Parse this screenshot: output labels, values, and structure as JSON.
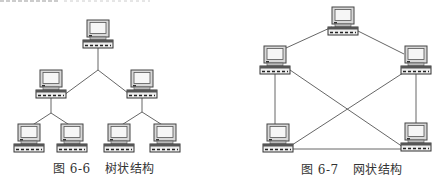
{
  "figures": [
    {
      "id": "fig-6-6",
      "caption_prefix": "图",
      "caption_number": "6-6",
      "caption_title": "树状结构",
      "topology": "tree",
      "nodes": [
        {
          "name": "root",
          "x": 98,
          "y": 20
        },
        {
          "name": "mid-left",
          "x": 51,
          "y": 70
        },
        {
          "name": "mid-right",
          "x": 142,
          "y": 70
        },
        {
          "name": "leaf-1",
          "x": 29,
          "y": 124
        },
        {
          "name": "leaf-2",
          "x": 72,
          "y": 124
        },
        {
          "name": "leaf-3",
          "x": 119,
          "y": 124
        },
        {
          "name": "leaf-4",
          "x": 165,
          "y": 124
        }
      ]
    },
    {
      "id": "fig-6-7",
      "caption_prefix": "图",
      "caption_number": "6-7",
      "caption_title": "网状结构",
      "topology": "mesh",
      "nodes": [
        {
          "name": "top",
          "x": 343,
          "y": 7
        },
        {
          "name": "left",
          "x": 275,
          "y": 46
        },
        {
          "name": "right",
          "x": 416,
          "y": 46
        },
        {
          "name": "bottom-left",
          "x": 278,
          "y": 124
        },
        {
          "name": "bottom-right",
          "x": 416,
          "y": 123
        }
      ]
    }
  ],
  "colors": {
    "line": "#555555",
    "monitor_frame": "#444444",
    "screen": "#f4f4f4",
    "base": "#3a3a3a",
    "text": "#333333"
  }
}
